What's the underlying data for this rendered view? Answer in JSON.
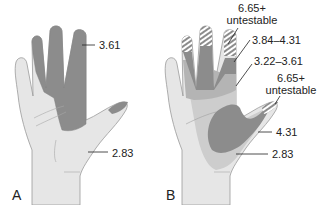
{
  "panels": [
    {
      "id": "A",
      "label": "A",
      "annotations": [
        {
          "text": "3.61",
          "region": "index-middle-ring fingers and central palm"
        },
        {
          "text": "2.83",
          "region": "remainder of palm"
        }
      ]
    },
    {
      "id": "B",
      "label": "B",
      "annotations": [
        {
          "text_line1": "6.65+",
          "text_line2": "untestable",
          "region": "fingertips (hatched)"
        },
        {
          "text": "3.84–4.31",
          "region": "mid finger segments"
        },
        {
          "text": "3.22–3.61",
          "region": "proximal finger segments"
        },
        {
          "text_line1": "6.65+",
          "text_line2": "untestable",
          "region": "thumb tip (hatched)"
        },
        {
          "text": "4.31",
          "region": "thenar and central palm"
        },
        {
          "text": "2.83",
          "region": "outer palm band"
        }
      ]
    }
  ],
  "colors": {
    "skin": "#e6e6e6",
    "outline": "#9a9a9a",
    "dark_zone": "#8c8c8c",
    "medium_zone": "#b4b4b4",
    "light_zone": "#cdcdcd",
    "hatch": "#ffffff"
  }
}
